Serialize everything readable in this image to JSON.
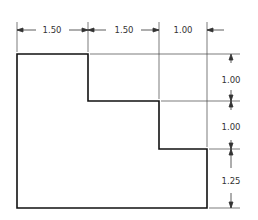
{
  "diagram": {
    "type": "stepped-profile-dimensioned-drawing",
    "colors": {
      "outline": "#111111",
      "dimension": "#333333",
      "background": "#ffffff"
    },
    "horizontal_dimensions": [
      {
        "label": "1.50",
        "x1": 17,
        "x2": 88,
        "text_x": 52
      },
      {
        "label": "1.50",
        "x1": 88,
        "x2": 159,
        "text_x": 124
      },
      {
        "label": "1.00",
        "x1": 159,
        "x2": 207,
        "text_x": 183
      }
    ],
    "vertical_dimensions": [
      {
        "label": "1.00",
        "y1": 54,
        "y2": 101,
        "text_y": 80
      },
      {
        "label": "1.00",
        "y1": 101,
        "y2": 149,
        "text_y": 127
      },
      {
        "label": "1.25",
        "y1": 149,
        "y2": 208,
        "text_y": 181
      }
    ]
  }
}
